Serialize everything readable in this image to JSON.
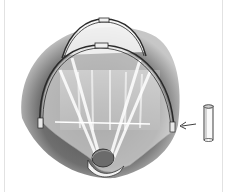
{
  "illustration": {
    "subject": "row cover hoop tunnel over garden bed",
    "parts": [
      "ground-foliage",
      "rear-hoop",
      "front-hoop",
      "netting-cover",
      "rock-weight",
      "pipe-fitting",
      "pointer-arrow"
    ],
    "colors": {
      "background": "#ffffff",
      "foliage_dark": "#3a3a3a",
      "foliage_mid": "#8a8a8a",
      "netting": "#f2f2f2",
      "outline": "#2a2a2a",
      "edge_line": "#e2e2e2"
    }
  }
}
